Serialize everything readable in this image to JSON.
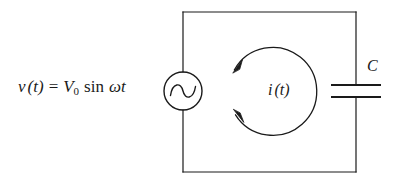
{
  "figure": {
    "name": "ac-source-capacitor-circuit",
    "background_color": "#ffffff",
    "stroke_color": "#1a1a1a",
    "width": 405,
    "height": 182
  },
  "labels": {
    "source_voltage": {
      "v": "v",
      "of_t_open": "(",
      "t": "t",
      "of_t_close": ")",
      "equals": "=",
      "V": "V",
      "V_subscript": "0",
      "sin": "sin",
      "omega": "ω",
      "omega_t": "t"
    },
    "current": {
      "i": "i",
      "open_paren": "(",
      "t": "t",
      "close_paren": ")"
    },
    "capacitor": {
      "C": "C"
    }
  },
  "components": {
    "ac_source": {
      "name": "ac-voltage-source",
      "center_x": 183,
      "center_y": 91,
      "radius": 19,
      "symbol": "sine-wave"
    },
    "capacitor": {
      "name": "capacitor",
      "center_x": 356,
      "plate_top_y": 85,
      "plate_bottom_y": 97,
      "plate_half_width": 25
    },
    "current_loop": {
      "name": "current-direction-loop",
      "center_x": 276,
      "center_y": 91,
      "radius": 44,
      "direction": "counterclockwise",
      "arrowheads": 2
    },
    "wire_loop": {
      "name": "circuit-wire-rectangle",
      "left": 183,
      "top": 12,
      "right": 356,
      "bottom": 172
    }
  }
}
